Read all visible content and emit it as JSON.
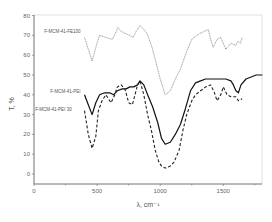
{
  "chart_data": {
    "type": "line",
    "title": "",
    "xlabel": "λ, cm⁻¹",
    "ylabel": "T, %",
    "xlim": [
      0,
      1810
    ],
    "ylim": [
      -5,
      80
    ],
    "xticks": [
      0,
      500,
      1000,
      1500
    ],
    "yticks": [
      0,
      10,
      20,
      30,
      40,
      50,
      60,
      70,
      80
    ],
    "grid": false,
    "legend": "inline labels",
    "series": [
      {
        "name": "F-MCM-41-FE100",
        "style": "solid-gray",
        "label_pos": [
          400,
          71
        ],
        "x": [
          400,
          430,
          460,
          490,
          520,
          570,
          620,
          645,
          665,
          690,
          720,
          760,
          785,
          810,
          840,
          870,
          895,
          930,
          960,
          1000,
          1040,
          1080,
          1120,
          1160,
          1210,
          1250,
          1290,
          1315,
          1350,
          1380,
          1400,
          1420,
          1450,
          1480,
          1520,
          1560,
          1600,
          1615,
          1635,
          1650
        ],
        "values": [
          69,
          63,
          57,
          64,
          70,
          69,
          68,
          71,
          74,
          72,
          71,
          70,
          69,
          72,
          75,
          73,
          71,
          65,
          58,
          48,
          40,
          42,
          48,
          53,
          62,
          68,
          70,
          71,
          72,
          73,
          68,
          64,
          68,
          69,
          63,
          66,
          65,
          67,
          66,
          69
        ]
      },
      {
        "name": "F-MCM-41-PEI",
        "style": "solid-black",
        "label_pos": [
          400,
          41
        ],
        "x": [
          400,
          430,
          460,
          490,
          520,
          560,
          600,
          630,
          660,
          700,
          730,
          760,
          790,
          820,
          840,
          870,
          900,
          940,
          980,
          1010,
          1040,
          1080,
          1120,
          1160,
          1200,
          1240,
          1280,
          1320,
          1360,
          1400,
          1440,
          1480,
          1520,
          1560,
          1580,
          1600,
          1620,
          1640,
          1680,
          1720,
          1760,
          1810
        ],
        "values": [
          40,
          35,
          30,
          36,
          40,
          41,
          41,
          40,
          42,
          43,
          43,
          44,
          44,
          45,
          47,
          45,
          40,
          34,
          26,
          18,
          15,
          16,
          20,
          25,
          33,
          42,
          46,
          47,
          48,
          48,
          48,
          48,
          48,
          47,
          45,
          42,
          41,
          45,
          48,
          49,
          50,
          50
        ]
      },
      {
        "name": "F-MCM-41-PEI 30",
        "style": "dashed-black",
        "label_pos": [
          330,
          32
        ],
        "x": [
          400,
          430,
          460,
          490,
          510,
          540,
          570,
          610,
          640,
          660,
          690,
          720,
          750,
          780,
          800,
          820,
          840,
          870,
          900,
          930,
          960,
          990,
          1010,
          1040,
          1080,
          1110,
          1150,
          1180,
          1210,
          1250,
          1280,
          1320,
          1360,
          1400,
          1430,
          1450,
          1480,
          1500,
          1530,
          1560,
          1600,
          1620,
          1650
        ],
        "values": [
          32,
          20,
          13,
          19,
          32,
          37,
          40,
          36,
          40,
          44,
          45,
          43,
          36,
          35,
          40,
          45,
          47,
          40,
          30,
          22,
          12,
          6,
          4,
          3,
          4,
          6,
          12,
          22,
          30,
          37,
          40,
          42,
          44,
          45,
          41,
          37,
          40,
          44,
          40,
          39,
          39,
          37,
          38
        ]
      }
    ]
  }
}
